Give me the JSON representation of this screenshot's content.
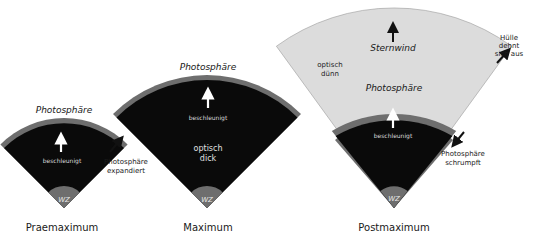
{
  "colors": {
    "core": "#0a0a0a",
    "photosphere_band": "#6e6e6e",
    "envelope": "#dcdcdc",
    "wz": "#6e6e6e",
    "text": "#1a1a1a",
    "text_on_dark": "#d8d8d8"
  },
  "panels": [
    {
      "id": "praemaximum",
      "title": "Praemaximum",
      "photosphere_label": "Photosphäre",
      "core_label": "beschleunigt",
      "wz_label": "WZ",
      "side_note_line1": "Photosphäre",
      "side_note_line2": "expandiert",
      "side_arrow": "arrow-up-right"
    },
    {
      "id": "maximum",
      "title": "Maximum",
      "photosphere_label": "Photosphäre",
      "core_label": "beschleunigt",
      "optical_line1": "optisch",
      "optical_line2": "dick",
      "wz_label": "WZ"
    },
    {
      "id": "postmaximum",
      "title": "Postmaximum",
      "photosphere_label": "Photosphäre",
      "core_label": "beschleunigt",
      "wind_label": "Sternwind",
      "optical_line1": "optisch",
      "optical_line2": "dünn",
      "wz_label": "WZ",
      "side_note_top_line1": "Hülle",
      "side_note_top_line2": "dehnt",
      "side_note_top_line3": "sich aus",
      "side_note_bottom_line1": "Photosphäre",
      "side_note_bottom_line2": "schrumpft"
    }
  ]
}
